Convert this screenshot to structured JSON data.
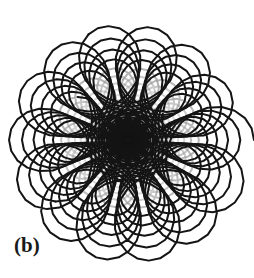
{
  "figure": {
    "panel_label": "(b)",
    "width": 254,
    "height": 278,
    "background_color": "#ffffff",
    "stroke_color": "#141414",
    "faded_stroke_color": "#9a9a9a"
  },
  "chart_data": {
    "type": "line",
    "title": "",
    "subtitle": "",
    "xlabel": "",
    "ylabel": "",
    "grid": false,
    "legend_position": "none",
    "axes_visible": false,
    "annotations": [
      {
        "text": "(b)",
        "x": 14,
        "y": 245,
        "role": "panel-label"
      }
    ],
    "xlim": [
      0,
      254
    ],
    "ylim": [
      0,
      278
    ],
    "center": {
      "x": 128,
      "y": 140
    },
    "series": [
      {
        "name": "spirograph-inward-sweep",
        "curve": "hypotrochoid",
        "parameter_name": "theta",
        "theta_start": 0,
        "theta_end": 226.19,
        "samples": 9000,
        "R_outer_start": 126,
        "R_outer_end": 2.0,
        "petal_count_outer": 36,
        "petal_count_middle": 13,
        "lobes_center": 2,
        "inner_ratio": 0.34,
        "freq_ratio": 13.0,
        "decay": "exponential",
        "linewidth_start": 2.0,
        "linewidth_end": 2.6,
        "color": "#141414"
      },
      {
        "name": "transition-strands",
        "curve": "hypotrochoid-faded",
        "theta_start": 29.0,
        "theta_end": 78.0,
        "color": "#9a9a9a",
        "linewidth": 2.0,
        "note": "Lighter gray strands visible on the left and lower-left where the curve radius sweeps quickly inward."
      }
    ],
    "rings": [
      {
        "name": "outer-rosette",
        "radius_px": 126,
        "petals": 36,
        "stroke": "#141414"
      },
      {
        "name": "middle-rosette",
        "radius_px": 62,
        "petals": 13,
        "stroke": "#141414"
      },
      {
        "name": "inner-rosette",
        "radius_px": 30,
        "petals": 9,
        "stroke": "#1a1a1a"
      },
      {
        "name": "center-lobes",
        "radius_px": 12,
        "petals": 2,
        "stroke": "#0d0d0d"
      }
    ]
  }
}
